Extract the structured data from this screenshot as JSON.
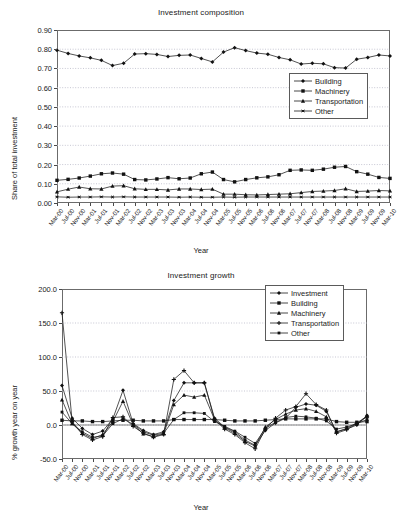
{
  "page": {
    "axis_title_x": "Year"
  },
  "chart_data": [
    {
      "id": "investment-composition",
      "type": "line",
      "title": "Investment composition",
      "xlabel": "Year",
      "ylabel": "Share of total  investment",
      "ylim": [
        0.0,
        0.9
      ],
      "ytick_labels": [
        "0.00",
        "0.10",
        "0.20",
        "0.30",
        "0.40",
        "0.50",
        "0.60",
        "0.70",
        "0.80",
        "0.90"
      ],
      "ytick_values": [
        0.0,
        0.1,
        0.2,
        0.3,
        0.4,
        0.5,
        0.6,
        0.7,
        0.8,
        0.9
      ],
      "grid": true,
      "legend_position": "upper-right-inside",
      "categories": [
        "Mar-00",
        "Jul-00",
        "Nov-00",
        "Mar-01",
        "Jul-01",
        "Nov-01",
        "Mar-02",
        "Jul-02",
        "Nov-02",
        "Mar-03",
        "Jul-03",
        "Nov-03",
        "Mar-04",
        "Jul-04",
        "Nov-04",
        "Mar-05",
        "Jul-05",
        "Nov-05",
        "Mar-06",
        "Jul-06",
        "Nov-06",
        "Mar-07",
        "Jul-07",
        "Nov-07",
        "Mar-08",
        "Jul-08",
        "Nov-08",
        "Mar-09",
        "Jul-09",
        "Nov-09",
        "Mar-10"
      ],
      "tick_every": 1,
      "series": [
        {
          "name": "Building",
          "marker": "diamond",
          "values": [
            0.795,
            0.778,
            0.765,
            0.755,
            0.742,
            0.715,
            0.727,
            0.775,
            0.777,
            0.773,
            0.762,
            0.768,
            0.77,
            0.752,
            0.734,
            0.785,
            0.808,
            0.793,
            0.78,
            0.774,
            0.757,
            0.745,
            0.723,
            0.727,
            0.724,
            0.704,
            0.702,
            0.748,
            0.757,
            0.77,
            0.765
          ]
        },
        {
          "name": "Machinery",
          "marker": "square",
          "values": [
            0.118,
            0.123,
            0.13,
            0.14,
            0.152,
            0.156,
            0.15,
            0.122,
            0.12,
            0.125,
            0.132,
            0.126,
            0.13,
            0.152,
            0.161,
            0.122,
            0.11,
            0.122,
            0.131,
            0.136,
            0.147,
            0.17,
            0.172,
            0.17,
            0.176,
            0.186,
            0.19,
            0.163,
            0.15,
            0.133,
            0.128
          ]
        },
        {
          "name": "Transportation",
          "marker": "triangle",
          "values": [
            0.058,
            0.072,
            0.083,
            0.074,
            0.073,
            0.088,
            0.09,
            0.074,
            0.071,
            0.071,
            0.068,
            0.073,
            0.073,
            0.07,
            0.072,
            0.046,
            0.046,
            0.043,
            0.042,
            0.044,
            0.046,
            0.048,
            0.054,
            0.06,
            0.062,
            0.065,
            0.074,
            0.06,
            0.062,
            0.065,
            0.063
          ]
        },
        {
          "name": "Other",
          "marker": "star",
          "values": [
            0.032,
            0.03,
            0.031,
            0.031,
            0.032,
            0.031,
            0.032,
            0.031,
            0.031,
            0.031,
            0.031,
            0.03,
            0.031,
            0.03,
            0.03,
            0.031,
            0.03,
            0.031,
            0.031,
            0.031,
            0.031,
            0.031,
            0.031,
            0.031,
            0.031,
            0.031,
            0.031,
            0.031,
            0.031,
            0.031,
            0.031
          ]
        }
      ]
    },
    {
      "id": "investment-growth",
      "type": "line",
      "title": "Investment growth",
      "xlabel": "Year",
      "ylabel": "% growth year on year",
      "ylim": [
        -50.0,
        200.0
      ],
      "ytick_labels": [
        "-50.0",
        "0.0",
        "50.0",
        "100.0",
        "150.0",
        "200.0"
      ],
      "ytick_values": [
        -50,
        0,
        50,
        100,
        150,
        200
      ],
      "grid": true,
      "legend_position": "upper-right-inside",
      "categories": [
        "Mar-00",
        "Jul-00",
        "Nov-00",
        "Mar-01",
        "Jul-01",
        "Nov-01",
        "Mar-02",
        "Jul-02",
        "Nov-02",
        "Mar-03",
        "Jul-03",
        "Nov-03",
        "Mar-04",
        "Jul-04",
        "Nov-04",
        "Mar-05",
        "Jul-05",
        "Nov-05",
        "Mar-06",
        "Jul-06",
        "Nov-06",
        "Mar-07",
        "Jul-07",
        "Nov-07",
        "Mar-08",
        "Jul-08",
        "Nov-08",
        "Mar-09",
        "Jul-09",
        "Nov-09",
        "Mar-10"
      ],
      "tick_every": 1,
      "series": [
        {
          "name": "Investment",
          "marker": "diamond",
          "values": [
            58,
            10,
            -5,
            -14,
            -9,
            9,
            51,
            2,
            -8,
            -14,
            -10,
            36,
            62,
            62,
            62,
            10,
            -3,
            -10,
            -22,
            -30,
            -8,
            3,
            10,
            26,
            31,
            29,
            20,
            -10,
            -6,
            0,
            14
          ]
        },
        {
          "name": "Building",
          "marker": "square",
          "values": [
            7,
            6,
            6,
            5,
            5,
            6,
            7,
            7,
            6,
            6,
            6,
            8,
            8,
            8,
            8,
            8,
            7,
            6,
            6,
            6,
            7,
            8,
            9,
            9,
            9,
            9,
            9,
            5,
            4,
            4,
            5
          ]
        },
        {
          "name": "Machinery",
          "marker": "triangle",
          "values": [
            37,
            2,
            -12,
            -20,
            -14,
            5,
            35,
            0,
            -13,
            -17,
            -13,
            30,
            44,
            41,
            44,
            8,
            -4,
            -12,
            -24,
            -31,
            -3,
            8,
            16,
            22,
            24,
            20,
            12,
            -10,
            -5,
            3,
            13
          ]
        },
        {
          "name": "Transportation",
          "marker": "plus",
          "values": [
            165,
            5,
            -14,
            -22,
            -17,
            11,
            12,
            -2,
            -12,
            -18,
            -14,
            67,
            80,
            62,
            62,
            8,
            -6,
            -14,
            -26,
            -35,
            -6,
            10,
            22,
            27,
            46,
            30,
            22,
            -12,
            -7,
            2,
            12
          ]
        },
        {
          "name": "Other",
          "marker": "square-small",
          "values": [
            19,
            2,
            -10,
            -18,
            -16,
            2,
            9,
            1,
            -10,
            -15,
            -12,
            8,
            18,
            18,
            17,
            5,
            -2,
            -9,
            -18,
            -27,
            -5,
            4,
            11,
            13,
            12,
            10,
            6,
            -6,
            -3,
            2,
            8
          ]
        }
      ]
    }
  ]
}
